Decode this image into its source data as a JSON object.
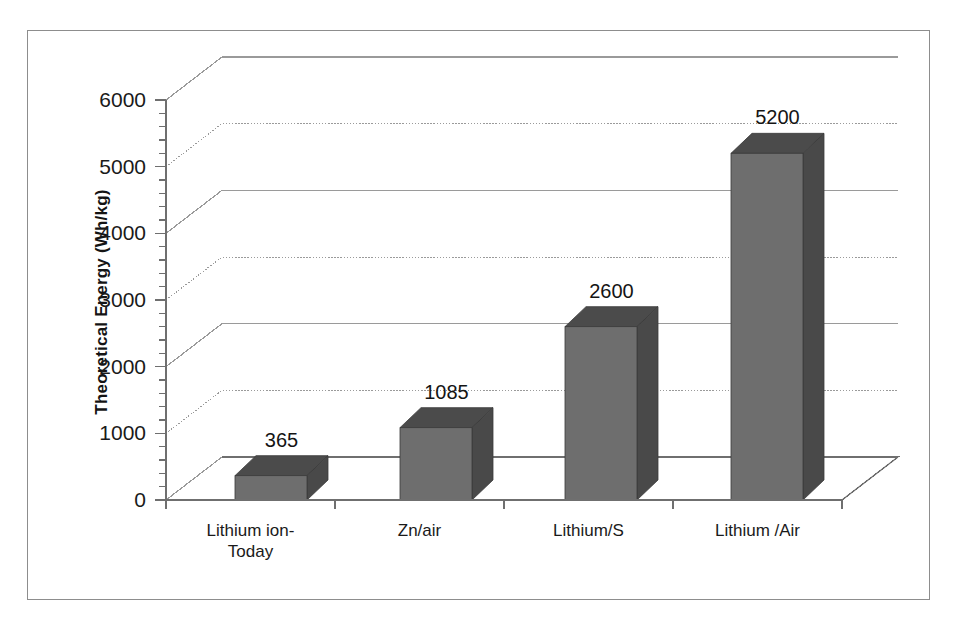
{
  "chart_data": {
    "type": "bar",
    "title": "",
    "subtitle": "",
    "xlabel": "",
    "ylabel": "Theoretical Energy (Wh/kg)",
    "categories": [
      "Lithium ion-Today",
      "Zn/air",
      "Lithium/S",
      "Lithium /Air"
    ],
    "category_lines": [
      [
        "Lithium ion-",
        "Today"
      ],
      [
        "Zn/air"
      ],
      [
        "Lithium/S"
      ],
      [
        "Lithium /Air"
      ]
    ],
    "values": [
      365,
      1085,
      2600,
      5200
    ],
    "value_labels": [
      "365",
      "1085",
      "2600",
      "5200"
    ],
    "ylim": [
      0,
      6000
    ],
    "ytick_step": 1000,
    "ytick_labels": [
      "6000",
      "5000",
      "4000",
      "3000",
      "2000",
      "1000",
      "0"
    ],
    "ytick_values": [
      6000,
      5000,
      4000,
      3000,
      2000,
      1000,
      0
    ],
    "minor_ticks_per_interval": 5,
    "grid": true,
    "grid_axis": "y",
    "legend": false,
    "legend_position": "none",
    "three_d": true,
    "series": [
      {
        "name": "Theoretical Energy",
        "values": [
          365,
          1085,
          2600,
          5200
        ]
      }
    ]
  },
  "style": {
    "bar_front_color": "#6e6e6e",
    "bar_top_color": "#4b4b4b",
    "bar_side_color": "#494949",
    "bar_edge_color": "#3a3a3a",
    "grid_color": "#9a9a9a",
    "axis_color": "#6f6f6f",
    "frame_color": "#8d8d8d",
    "background_color": "#ffffff",
    "text_color": "#1a1a1a"
  },
  "geometry": {
    "origin_x": 166,
    "origin_y": 500,
    "axis_top_y": 100,
    "px_per_unit": 0.0666,
    "depth_dx": 56,
    "depth_dy": -43,
    "bar_width": 72,
    "bar_depth_dx": 21,
    "bar_depth_dy": -20,
    "plot_right_x": 842,
    "bar_front_left_x": [
      235,
      400,
      565,
      731
    ]
  }
}
